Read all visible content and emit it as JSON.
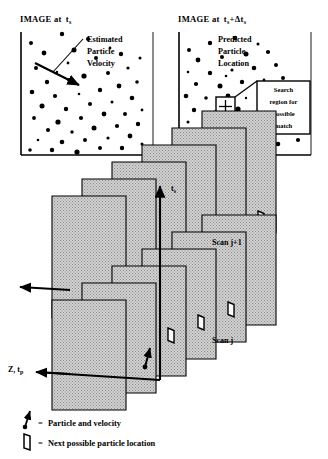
{
  "figure": {
    "kind": "particle-tracking-diagram",
    "panels": [
      {
        "id": "left",
        "title_prefix": "IMAGE at",
        "title_var": "t",
        "title_sub": "s",
        "title_full": "IMAGE at t_s",
        "annotation_lines": [
          "Estimated",
          "Particle",
          "Velocity"
        ],
        "annotation_full": "Estimated Particle Velocity"
      },
      {
        "id": "right",
        "title_prefix": "IMAGE at",
        "title_var": "t",
        "title_sub": "s",
        "title_suffix": "+Δt",
        "title_suffix_sub": "s",
        "title_full": "IMAGE at t_s+Δt_s",
        "annotation_lines": [
          "Predicted",
          "Particle",
          "Location"
        ],
        "annotation_full": "Predicted Particle Location",
        "callout_lines": [
          "Search",
          "region for",
          "possible",
          "match"
        ],
        "callout_full": "Search region for possible match"
      }
    ],
    "axes": {
      "vertical_label": "t",
      "vertical_sub": "s",
      "vertical_full": "t_s",
      "depth_label": "Z, t",
      "depth_sub": "p",
      "depth_full": "Z, t_p"
    },
    "scan_labels": {
      "upper": "Scan j+1",
      "lower": "Scan j"
    },
    "legend": {
      "equals": "=",
      "items": [
        {
          "symbol": "particle-velocity-arrow",
          "label": "Particle  and  velocity"
        },
        {
          "symbol": "next-location-quad",
          "label": "Next  possible  particle  location"
        }
      ]
    },
    "colors": {
      "ink": "#000000",
      "paper": "#ffffff",
      "plane_fill": "#c9c9c9",
      "plane_edge": "#000000"
    },
    "left_particles": [
      {
        "x": 9,
        "y": 33,
        "r": 2.0
      },
      {
        "x": 40,
        "y": 24,
        "r": 2.2
      },
      {
        "x": 66,
        "y": 29,
        "r": 2.1
      },
      {
        "x": 22,
        "y": 43,
        "r": 2.4
      },
      {
        "x": 52,
        "y": 40,
        "r": 2.5
      },
      {
        "x": 88,
        "y": 38,
        "r": 1.4
      },
      {
        "x": 14,
        "y": 58,
        "r": 2.0
      },
      {
        "x": 35,
        "y": 62,
        "r": 1.2
      },
      {
        "x": 74,
        "y": 48,
        "r": 2.0
      },
      {
        "x": 99,
        "y": 44,
        "r": 2.2
      },
      {
        "x": 25,
        "y": 72,
        "r": 2.2
      },
      {
        "x": 47,
        "y": 70,
        "r": 1.9
      },
      {
        "x": 62,
        "y": 66,
        "r": 2.6
      },
      {
        "x": 86,
        "y": 63,
        "r": 2.0
      },
      {
        "x": 106,
        "y": 58,
        "r": 1.6
      },
      {
        "x": 10,
        "y": 82,
        "r": 2.3
      },
      {
        "x": 33,
        "y": 86,
        "r": 2.1
      },
      {
        "x": 57,
        "y": 84,
        "r": 1.3
      },
      {
        "x": 78,
        "y": 80,
        "r": 2.2
      },
      {
        "x": 97,
        "y": 76,
        "r": 2.4
      },
      {
        "x": 115,
        "y": 72,
        "r": 1.8
      },
      {
        "x": 20,
        "y": 96,
        "r": 2.5
      },
      {
        "x": 44,
        "y": 99,
        "r": 2.2
      },
      {
        "x": 68,
        "y": 94,
        "r": 2.0
      },
      {
        "x": 90,
        "y": 92,
        "r": 1.5
      },
      {
        "x": 110,
        "y": 88,
        "r": 2.3
      },
      {
        "x": 12,
        "y": 108,
        "r": 1.9
      },
      {
        "x": 36,
        "y": 112,
        "r": 2.6
      },
      {
        "x": 59,
        "y": 108,
        "r": 2.1
      },
      {
        "x": 82,
        "y": 104,
        "r": 2.4
      },
      {
        "x": 103,
        "y": 104,
        "r": 2.0
      },
      {
        "x": 120,
        "y": 100,
        "r": 1.4
      },
      {
        "x": 26,
        "y": 120,
        "r": 2.0
      },
      {
        "x": 50,
        "y": 122,
        "r": 1.7
      },
      {
        "x": 72,
        "y": 118,
        "r": 2.5
      },
      {
        "x": 95,
        "y": 116,
        "r": 2.1
      },
      {
        "x": 116,
        "y": 114,
        "r": 2.2
      },
      {
        "x": 16,
        "y": 130,
        "r": 1.3
      },
      {
        "x": 40,
        "y": 132,
        "r": 2.3
      },
      {
        "x": 63,
        "y": 130,
        "r": 2.0
      },
      {
        "x": 86,
        "y": 128,
        "r": 1.6
      },
      {
        "x": 108,
        "y": 126,
        "r": 2.4
      },
      {
        "x": 30,
        "y": 140,
        "r": 2.2
      },
      {
        "x": 55,
        "y": 142,
        "r": 2.6
      },
      {
        "x": 78,
        "y": 138,
        "r": 2.0
      },
      {
        "x": 100,
        "y": 138,
        "r": 2.2
      },
      {
        "x": 120,
        "y": 134,
        "r": 1.5
      },
      {
        "x": 8,
        "y": 140,
        "r": 1.8
      },
      {
        "x": 46,
        "y": 53,
        "r": 1.4
      },
      {
        "x": 118,
        "y": 48,
        "r": 1.5
      }
    ],
    "right_particles": [
      {
        "x": 9,
        "y": 40,
        "r": 2.0
      },
      {
        "x": 30,
        "y": 33,
        "r": 2.2
      },
      {
        "x": 55,
        "y": 28,
        "r": 2.3
      },
      {
        "x": 78,
        "y": 34,
        "r": 1.5
      },
      {
        "x": 18,
        "y": 50,
        "r": 2.4
      },
      {
        "x": 42,
        "y": 47,
        "r": 2.0
      },
      {
        "x": 66,
        "y": 44,
        "r": 2.5
      },
      {
        "x": 88,
        "y": 42,
        "r": 2.1
      },
      {
        "x": 8,
        "y": 62,
        "r": 1.3
      },
      {
        "x": 30,
        "y": 63,
        "r": 2.2
      },
      {
        "x": 52,
        "y": 60,
        "r": 1.6
      },
      {
        "x": 74,
        "y": 58,
        "r": 2.3
      },
      {
        "x": 96,
        "y": 55,
        "r": 2.0
      },
      {
        "x": 16,
        "y": 74,
        "r": 2.1
      },
      {
        "x": 40,
        "y": 76,
        "r": 2.5
      },
      {
        "x": 62,
        "y": 72,
        "r": 2.2
      },
      {
        "x": 84,
        "y": 70,
        "r": 1.4
      },
      {
        "x": 103,
        "y": 68,
        "r": 2.0
      },
      {
        "x": 6,
        "y": 86,
        "r": 2.3
      },
      {
        "x": 26,
        "y": 88,
        "r": 1.8
      },
      {
        "x": 48,
        "y": 86,
        "r": 2.4
      },
      {
        "x": 92,
        "y": 84,
        "r": 2.1
      },
      {
        "x": 110,
        "y": 82,
        "r": 1.6
      },
      {
        "x": 14,
        "y": 100,
        "r": 2.2
      },
      {
        "x": 36,
        "y": 102,
        "r": 2.0
      },
      {
        "x": 58,
        "y": 99,
        "r": 2.6
      },
      {
        "x": 80,
        "y": 96,
        "r": 2.2
      },
      {
        "x": 100,
        "y": 96,
        "r": 1.9
      },
      {
        "x": 118,
        "y": 92,
        "r": 2.3
      },
      {
        "x": 8,
        "y": 112,
        "r": 1.5
      },
      {
        "x": 28,
        "y": 114,
        "r": 2.4
      },
      {
        "x": 50,
        "y": 112,
        "r": 2.0
      },
      {
        "x": 72,
        "y": 110,
        "r": 2.2
      },
      {
        "x": 94,
        "y": 108,
        "r": 1.3
      },
      {
        "x": 112,
        "y": 106,
        "r": 2.5
      },
      {
        "x": 20,
        "y": 126,
        "r": 2.1
      },
      {
        "x": 42,
        "y": 128,
        "r": 2.3
      },
      {
        "x": 64,
        "y": 124,
        "r": 1.7
      },
      {
        "x": 86,
        "y": 122,
        "r": 2.4
      },
      {
        "x": 106,
        "y": 120,
        "r": 2.0
      },
      {
        "x": 12,
        "y": 138,
        "r": 2.2
      },
      {
        "x": 34,
        "y": 140,
        "r": 2.6
      },
      {
        "x": 56,
        "y": 138,
        "r": 2.0
      },
      {
        "x": 78,
        "y": 136,
        "r": 1.5
      },
      {
        "x": 98,
        "y": 134,
        "r": 2.3
      },
      {
        "x": 118,
        "y": 130,
        "r": 2.1
      },
      {
        "x": 66,
        "y": 88,
        "r": 1.2
      },
      {
        "x": 46,
        "y": 66,
        "r": 1.3
      }
    ]
  }
}
